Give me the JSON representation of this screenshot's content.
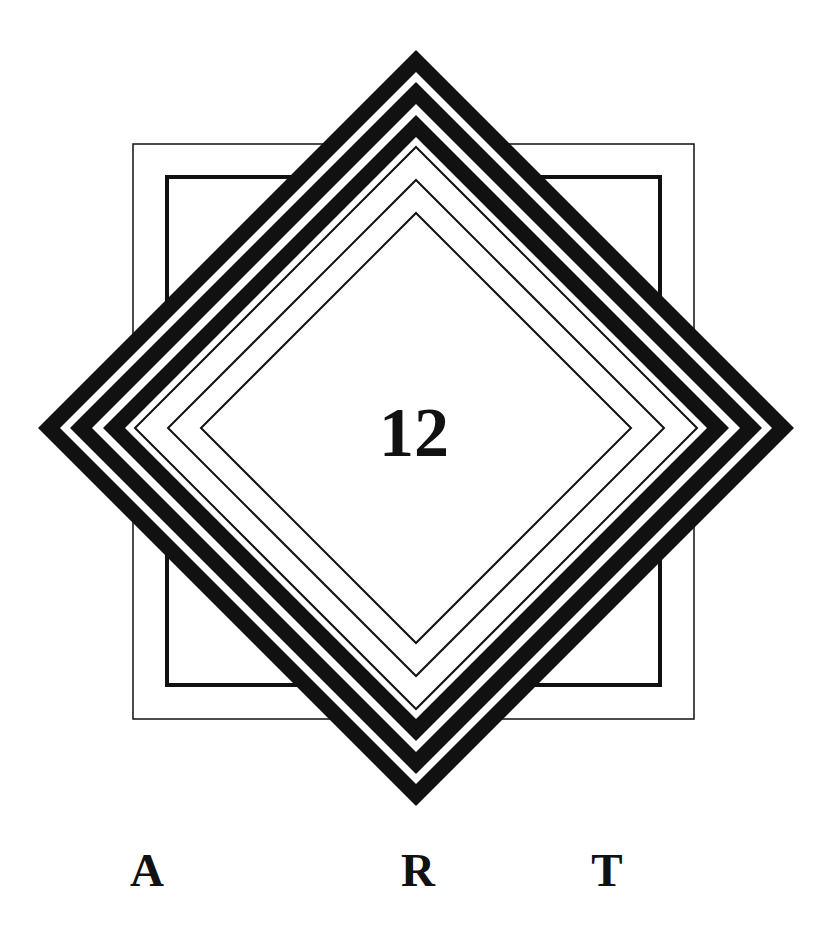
{
  "artwork": {
    "center_label": "12",
    "bottom_letters": [
      "A",
      "R",
      "T"
    ],
    "colors": {
      "background": "#ffffff",
      "ink": "#111111"
    },
    "center": {
      "x": 416,
      "y": 428
    },
    "outer_square": {
      "x": 133,
      "y": 144,
      "width": 561,
      "height": 575,
      "stroke": 1.5
    },
    "inner_square": {
      "x": 167,
      "y": 177,
      "width": 493,
      "height": 508,
      "stroke": 4
    },
    "filled_bands_radii": [
      378,
      356,
      346,
      324,
      313,
      291
    ],
    "thin_line_radii": [
      281,
      248,
      215
    ]
  }
}
